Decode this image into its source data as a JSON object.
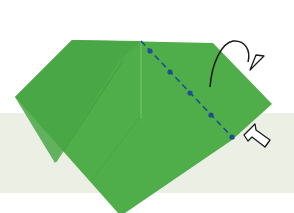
{
  "diagram": {
    "type": "origami-fold-step",
    "colors": {
      "background": "#ffffff",
      "band": "#ecefe4",
      "paper": "#4fae4a",
      "paper_shade": "#47a343",
      "crease": "#79c06f",
      "fold_line": "#1f4f8c",
      "arrow": "#1a1a1a",
      "push_arrow_fill": "#ffffff"
    },
    "paper_polygon": [
      [
        72,
        40
      ],
      [
        213,
        43
      ],
      [
        272,
        104
      ],
      [
        232,
        140
      ],
      [
        125,
        213
      ],
      [
        118,
        213
      ],
      [
        15,
        97
      ]
    ],
    "fold_line": {
      "style": "dash-dot",
      "from": [
        141,
        41
      ],
      "to": [
        234,
        139
      ],
      "dots": [
        [
          150,
          51
        ],
        [
          170,
          72
        ],
        [
          190,
          93
        ],
        [
          211,
          115
        ],
        [
          232,
          137
        ]
      ]
    },
    "annotations": [
      {
        "kind": "valley-fold-back-arrow",
        "label": "fold behind"
      },
      {
        "kind": "push-arrow",
        "label": "push in"
      }
    ]
  }
}
